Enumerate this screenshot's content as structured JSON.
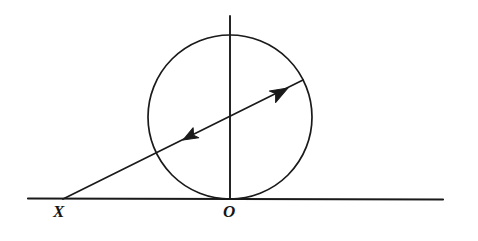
{
  "figure": {
    "background_color": "#ffffff",
    "ink_color": "#1a1a1a",
    "width": 478,
    "height": 241,
    "labels": {
      "external_point": "X",
      "tangent_point": "O"
    },
    "elements": {
      "tangent_line_name": "tangent-line",
      "circle_name": "circle",
      "diameter_name": "vertical-diameter",
      "secant_name": "secant-ray",
      "arrow_up_name": "arrowhead-up-right",
      "arrow_down_name": "arrowhead-down-left"
    }
  },
  "chart_data": {
    "type": "diagram",
    "coordinate_space": {
      "width": 478,
      "height": 241,
      "origin": "top-left",
      "units": "pixels"
    },
    "circle": {
      "center_x": 230,
      "center_y": 117,
      "radius": 82,
      "stroke_width": 1.7,
      "stroke": "#1a1a1a",
      "fill": "none"
    },
    "lines": [
      {
        "name": "tangent-line",
        "x1": 28,
        "y1": 198.5,
        "x2": 443,
        "y2": 199.5,
        "stroke_width": 2.2,
        "description": "horizontal tangent line touching circle at O"
      },
      {
        "name": "vertical-diameter",
        "x1": 230,
        "y1": 16,
        "x2": 230,
        "y2": 199,
        "stroke_width": 1.9,
        "description": "vertical line through circle center from above the circle down to O"
      },
      {
        "name": "secant-ray",
        "x1": 63,
        "y1": 199,
        "x2": 303,
        "y2": 80,
        "stroke_width": 1.7,
        "description": "oblique line from external point X up through the circle to its far boundary"
      }
    ],
    "arrowheads": [
      {
        "name": "arrowhead-up-right",
        "tip_x": 288,
        "tip_y": 88,
        "angle_deg": -26.4,
        "direction": "up-right",
        "size": 17
      },
      {
        "name": "arrowhead-down-left",
        "tip_x": 183,
        "tip_y": 140,
        "angle_deg": 153.6,
        "direction": "down-left",
        "size": 14
      }
    ],
    "point_labels": [
      {
        "text": "X",
        "x": 62,
        "y": 212,
        "style": "bold-italic-serif"
      },
      {
        "text": "O",
        "x": 232,
        "y": 212,
        "style": "italic-serif"
      }
    ]
  }
}
